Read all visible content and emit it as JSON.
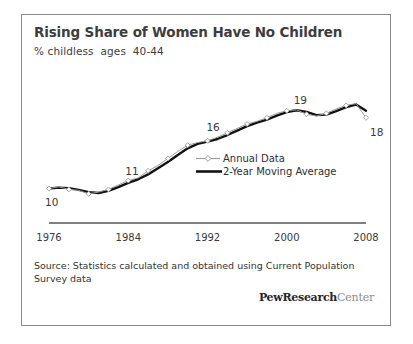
{
  "figure": {
    "title": "Rising Share of Women Have No Children",
    "subtitle": "% childless  ages  40-44",
    "source_note": "Source: Statistics calculated and obtained using Current Population Survey data",
    "logo_bold": "PewResearch",
    "logo_light": "Center",
    "border_color": "#8a8a8a",
    "background": "#ffffff"
  },
  "chart_data": {
    "type": "line",
    "title": "Rising Share of Women Have No Children",
    "subtitle": "% childless  ages  40-44",
    "xlabel": "",
    "ylabel": "% childless",
    "xlim": [
      1976,
      2008
    ],
    "ylim": [
      8,
      21
    ],
    "grid": false,
    "legend_position": "inside-center-right",
    "tick_labels": [
      "1976",
      "1984",
      "1992",
      "2000",
      "2008"
    ],
    "ticks": [
      1976,
      1984,
      1992,
      2000,
      2008
    ],
    "annotations": [
      {
        "text": "10",
        "x": 1976,
        "y": 10,
        "position": "below-left"
      },
      {
        "text": "11",
        "x": 1984,
        "y": 11,
        "position": "above"
      },
      {
        "text": "16",
        "x": 1993,
        "y": 16,
        "position": "above-left"
      },
      {
        "text": "19",
        "x": 2001,
        "y": 19,
        "position": "above"
      },
      {
        "text": "18",
        "x": 2008,
        "y": 18,
        "position": "below-right"
      }
    ],
    "x": [
      1976,
      1977,
      1978,
      1979,
      1980,
      1981,
      1982,
      1983,
      1984,
      1985,
      1986,
      1987,
      1988,
      1989,
      1990,
      1991,
      1992,
      1993,
      1994,
      1995,
      1996,
      1997,
      1998,
      1999,
      2000,
      2001,
      2002,
      2003,
      2004,
      2005,
      2006,
      2007,
      2008
    ],
    "series": [
      {
        "name": "Annual Data",
        "color": "#9a9a9a",
        "marker": "diamond",
        "width": 1,
        "values": [
          10.2,
          10.4,
          10.1,
          10.0,
          9.6,
          9.8,
          10.1,
          10.6,
          11.1,
          11.4,
          12.2,
          12.8,
          13.6,
          14.4,
          15.1,
          15.4,
          15.6,
          16.0,
          16.5,
          17.0,
          17.5,
          17.8,
          18.2,
          18.7,
          19.0,
          19.1,
          18.6,
          18.4,
          18.7,
          19.2,
          19.6,
          19.8,
          18.2
        ]
      },
      {
        "name": "2-Year Moving Average",
        "color": "#121212",
        "marker": "none",
        "width": 2.4,
        "values": [
          10.2,
          10.3,
          10.25,
          10.05,
          9.8,
          9.7,
          9.95,
          10.35,
          10.85,
          11.25,
          11.8,
          12.5,
          13.2,
          14.0,
          14.75,
          15.25,
          15.5,
          15.8,
          16.25,
          16.75,
          17.25,
          17.65,
          18.0,
          18.45,
          18.85,
          19.05,
          18.85,
          18.5,
          18.55,
          18.95,
          19.4,
          19.7,
          19.0
        ]
      }
    ]
  },
  "legend": {
    "items": [
      {
        "label": "Annual Data",
        "color": "#9a9a9a",
        "style": "thin-marker"
      },
      {
        "label": "2-Year Moving Average",
        "color": "#121212",
        "style": "thick"
      }
    ]
  }
}
